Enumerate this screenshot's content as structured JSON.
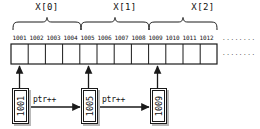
{
  "diagram": {
    "groups": [
      {
        "label": "X[0]",
        "start_address": "1001",
        "cells": 4
      },
      {
        "label": "X[1]",
        "start_address": "1005",
        "cells": 4
      },
      {
        "label": "X[2]",
        "start_address": "1009",
        "cells": 4
      }
    ],
    "addresses": [
      "1001",
      "1002",
      "1003",
      "1004",
      "1005",
      "1006",
      "1007",
      "1008",
      "1009",
      "1010",
      "1011",
      "1012"
    ],
    "continuation": {
      "upper": "........",
      "lower": "........"
    },
    "pointer_boxes": [
      {
        "value": "1001",
        "points_to_address": "1001"
      },
      {
        "value": "1005",
        "points_to_address": "1005"
      },
      {
        "value": "1009",
        "points_to_address": "1009"
      }
    ],
    "transitions": [
      {
        "label": "ptr++",
        "from": "1001",
        "to": "1005"
      },
      {
        "label": "ptr++",
        "from": "1005",
        "to": "1009"
      }
    ],
    "colors": {
      "stroke": "#1a1a1a",
      "shadow": "#b9b9b9",
      "cell_fill": "#ffffff",
      "background": "#ffffff"
    }
  }
}
